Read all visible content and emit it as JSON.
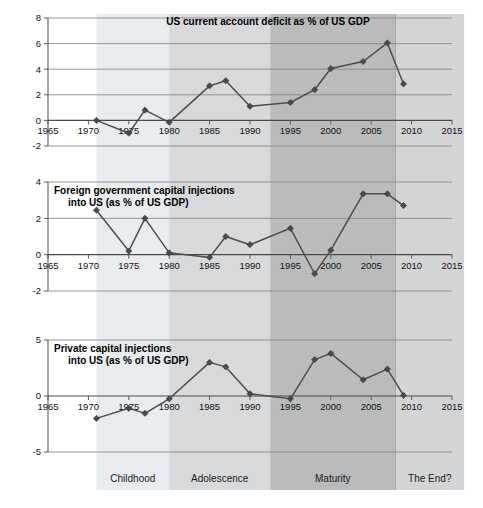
{
  "figure": {
    "width": 483,
    "height": 508,
    "background": "#ffffff",
    "line_color": "#4d4d4d",
    "marker_color": "#4a4a4a",
    "grid_color": "#8a8a8a"
  },
  "x_axis": {
    "label": "",
    "ticks": [
      1965,
      1970,
      1975,
      1980,
      1985,
      1990,
      1995,
      2000,
      2005,
      2010,
      2015
    ],
    "tick_labels": [
      "1965",
      "1970",
      "1975",
      "1980",
      "1985",
      "1990",
      "1995",
      "2000",
      "2005",
      "2010",
      "2015"
    ],
    "xlim": [
      1965,
      2016.5
    ]
  },
  "bands": [
    {
      "label": "Childhood",
      "start": 1971.0,
      "end": 1980.0,
      "color": "#e9ecef"
    },
    {
      "label": "Adolescence",
      "start": 1980.0,
      "end": 1992.5,
      "color": "#d7d9da"
    },
    {
      "label": "Maturity",
      "start": 1992.5,
      "end": 2008.0,
      "color": "#b9bbbc"
    },
    {
      "label": "The End?",
      "start": 2008.0,
      "end": 2016.5,
      "color": "#d2d4d5"
    }
  ],
  "chart_data": [
    {
      "type": "line",
      "title": "US current account deficit as % of US GDP",
      "title_position": "inside-top-center",
      "xlabel": "",
      "ylabel": "",
      "ylim": [
        -2,
        8
      ],
      "yticks": [
        -2,
        0,
        2,
        4,
        6,
        8
      ],
      "ytick_labels": [
        "-2",
        "0",
        "2",
        "4",
        "6",
        "8"
      ],
      "grid": true,
      "legend": "none",
      "x": [
        1971,
        1975,
        1977,
        1980,
        1985,
        1987,
        1990,
        1995,
        1998,
        2000,
        2004,
        2007,
        2009
      ],
      "values": [
        0.0,
        -1.0,
        0.8,
        -0.15,
        2.7,
        3.1,
        1.1,
        1.4,
        2.4,
        4.05,
        4.6,
        6.05,
        2.85
      ]
    },
    {
      "type": "line",
      "title": "Foreign government capital injections into US (as % of US GDP)",
      "title_line_1": "Foreign government capital injections",
      "title_line_2": "into US (as % of US GDP)",
      "title_position": "inside-top-left",
      "xlabel": "",
      "ylabel": "",
      "ylim": [
        -2,
        4
      ],
      "yticks": [
        -2,
        0,
        2,
        4
      ],
      "ytick_labels": [
        "-2",
        "0",
        "2",
        "4"
      ],
      "grid": true,
      "legend": "none",
      "x": [
        1971,
        1975,
        1977,
        1980,
        1985,
        1987,
        1990,
        1995,
        1998,
        2000,
        2004,
        2007,
        2009
      ],
      "values": [
        2.45,
        0.2,
        2.0,
        0.1,
        -0.15,
        1.0,
        0.55,
        1.45,
        -1.05,
        0.25,
        3.35,
        3.35,
        2.7
      ]
    },
    {
      "type": "line",
      "title": "Private capital injections into US (as % of US GDP)",
      "title_line_1": "Private capital injections",
      "title_line_2": "into US (as % of US GDP)",
      "title_position": "inside-top-left",
      "xlabel": "",
      "ylabel": "",
      "ylim": [
        -5,
        5
      ],
      "yticks": [
        -5,
        0,
        5
      ],
      "ytick_labels": [
        "-5",
        "0",
        "5"
      ],
      "grid": true,
      "legend": "none",
      "x": [
        1971,
        1975,
        1977,
        1980,
        1985,
        1987,
        1990,
        1995,
        1998,
        2000,
        2004,
        2007,
        2009
      ],
      "values": [
        -2.0,
        -1.1,
        -1.55,
        -0.25,
        3.0,
        2.6,
        0.2,
        -0.25,
        3.25,
        3.8,
        1.45,
        2.4,
        0.05
      ]
    }
  ]
}
